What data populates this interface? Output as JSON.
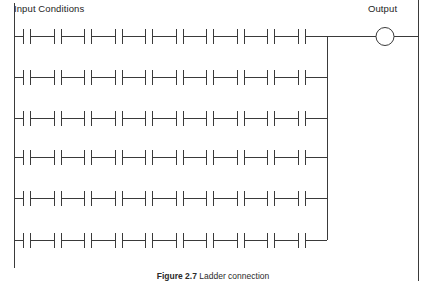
{
  "header": {
    "input_label": "Input Conditions",
    "output_label": "Output"
  },
  "caption": {
    "figure_number": "Figure 2.7",
    "text": " Ladder connection"
  },
  "diagram": {
    "type": "ladder-logic-diagram",
    "stroke_color": "#3a3a3a",
    "background_color": "#ffffff",
    "left_rail": {
      "x": 14,
      "y_top": 3,
      "y_bottom": 268
    },
    "right_rail": {
      "x": 418,
      "y_top": 0,
      "y_bottom": 281
    },
    "branch_rail": {
      "x": 327,
      "y_top": 36,
      "y_bottom": 240
    },
    "rows": [
      {
        "index": 1,
        "y": 36,
        "contacts": 10
      },
      {
        "index": 2,
        "y": 77,
        "contacts": 10
      },
      {
        "index": 3,
        "y": 118,
        "contacts": 10
      },
      {
        "index": 4,
        "y": 157,
        "contacts": 10
      },
      {
        "index": 5,
        "y": 198,
        "contacts": 10
      },
      {
        "index": 6,
        "y": 240,
        "contacts": 10
      }
    ],
    "contact": {
      "pitch": 30.5,
      "first_center_x": 27,
      "gap": 7,
      "bar_height": 15
    },
    "output_coil": {
      "center_x": 385,
      "center_y": 36,
      "radius": 9
    }
  }
}
